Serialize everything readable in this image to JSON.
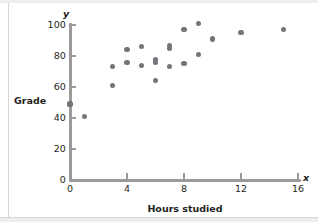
{
  "figure": {
    "axis_letters": {
      "x": "x",
      "y": "y"
    },
    "point_color": "#74747a",
    "axis_color": "#9a9a9a",
    "text_color": "#231f20"
  },
  "chart_data": {
    "type": "scatter",
    "title": "",
    "xlabel": "Hours studied",
    "ylabel": "Grade",
    "xlim": [
      0,
      16
    ],
    "ylim": [
      0,
      100
    ],
    "xticks": [
      0,
      4,
      8,
      12,
      16
    ],
    "yticks": [
      0,
      20,
      40,
      60,
      80,
      100
    ],
    "xtick_labels": [
      "0",
      "4",
      "8",
      "12",
      "16"
    ],
    "ytick_labels": [
      "0",
      "20",
      "40",
      "60",
      "80",
      "100"
    ],
    "grid": false,
    "legend": null,
    "series": [
      {
        "name": "students",
        "marker": "circle",
        "color": "#74747a",
        "points": [
          {
            "x": 0,
            "y": 49
          },
          {
            "x": 1,
            "y": 41
          },
          {
            "x": 3,
            "y": 73
          },
          {
            "x": 3,
            "y": 61
          },
          {
            "x": 4,
            "y": 84
          },
          {
            "x": 4,
            "y": 76
          },
          {
            "x": 5,
            "y": 86
          },
          {
            "x": 5,
            "y": 74
          },
          {
            "x": 6,
            "y": 78
          },
          {
            "x": 6,
            "y": 76
          },
          {
            "x": 6,
            "y": 64
          },
          {
            "x": 7,
            "y": 87
          },
          {
            "x": 7,
            "y": 85
          },
          {
            "x": 7,
            "y": 73
          },
          {
            "x": 8,
            "y": 97
          },
          {
            "x": 8,
            "y": 75
          },
          {
            "x": 9,
            "y": 101
          },
          {
            "x": 9,
            "y": 81
          },
          {
            "x": 10,
            "y": 91
          },
          {
            "x": 12,
            "y": 95
          },
          {
            "x": 15,
            "y": 97
          }
        ]
      }
    ]
  }
}
